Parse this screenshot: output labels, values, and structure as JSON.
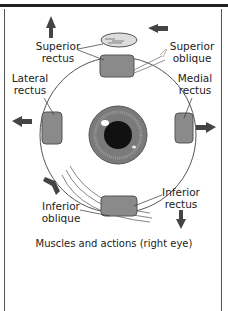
{
  "diagram": {
    "caption": "Muscles and actions (right eye)",
    "labels": {
      "superior_rectus": "Superior rectus",
      "superior_oblique": "Superior oblique",
      "lateral_rectus": "Lateral rectus",
      "medial_rectus": "Medial rectus",
      "inferior_oblique": "Inferior oblique",
      "inferior_rectus": "Inferior rectus"
    },
    "arrows": {
      "superior_rectus": "up",
      "superior_oblique": "left",
      "lateral_rectus": "left",
      "medial_rectus": "right",
      "inferior_oblique": "down-right",
      "inferior_rectus": "down"
    },
    "colors": {
      "muscle": "#8a8a8a",
      "iris": "#7a7a7a",
      "pupil": "#111111",
      "arrow": "#444444",
      "line": "#555555"
    }
  }
}
